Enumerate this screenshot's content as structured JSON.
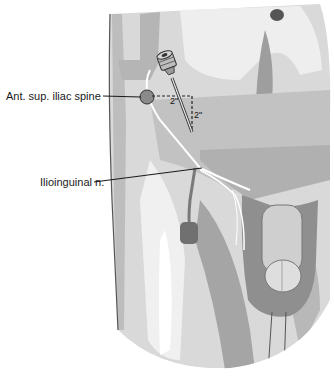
{
  "figure": {
    "labels": {
      "asis": "Ant. sup. iliac spine",
      "ilioinguinal": "Ilioinguinal n."
    },
    "dimensions": {
      "horizontal": "2\"",
      "vertical": "2\""
    },
    "icons": [
      "needle-syringe-icon",
      "iliac-spine-marker-icon",
      "umbilicus-icon"
    ],
    "colors": {
      "skin_light": "#e6e6e6",
      "skin_mid": "#c8c8c8",
      "skin_dark": "#a8a8a8",
      "shadow": "#8c8c8c",
      "line": "#1a1a1a",
      "nerve": "#ffffff"
    }
  }
}
